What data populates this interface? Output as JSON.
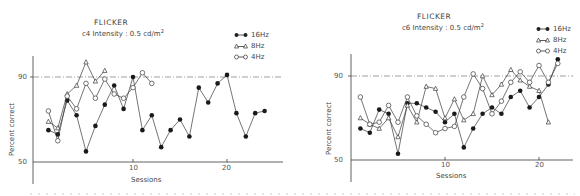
{
  "chart_data": [
    {
      "type": "line",
      "title": "FLICKER",
      "subtitle": "c4 Intensity : 0.5 cd/m²",
      "xlabel": "Sessions",
      "ylabel": "Percent correct",
      "ylim": [
        50,
        100
      ],
      "xlim": [
        0,
        26
      ],
      "yticks": [
        50,
        90
      ],
      "xticks": [
        10,
        20
      ],
      "reference_line": {
        "y": 90,
        "style": "dash-dot"
      },
      "grid": false,
      "legend_position": "top-right",
      "series": [
        {
          "name": "16Hz",
          "marker": "filled-circle",
          "x": [
            1,
            2,
            3,
            4,
            5,
            6,
            7,
            8,
            9,
            10,
            11,
            12,
            13,
            14,
            15,
            16,
            17,
            18,
            19,
            20,
            21,
            22,
            23,
            24
          ],
          "values": [
            65,
            63,
            79,
            72,
            55,
            67,
            77,
            86,
            75,
            90,
            65,
            72,
            57,
            65,
            70,
            62,
            85,
            78,
            87,
            91,
            73,
            62,
            73,
            74
          ]
        },
        {
          "name": "8Hz",
          "marker": "open-triangle",
          "x": [
            1,
            2,
            3,
            4,
            5,
            6,
            7
          ],
          "values": [
            69,
            66,
            82,
            86,
            97,
            88,
            93
          ]
        },
        {
          "name": "4Hz",
          "marker": "open-circle",
          "x": [
            1,
            2,
            3,
            4,
            5,
            6,
            7,
            8,
            9,
            10,
            11,
            12
          ],
          "values": [
            74,
            60,
            81,
            75,
            87,
            80,
            89,
            82,
            80,
            85,
            92,
            87
          ]
        }
      ]
    },
    {
      "type": "line",
      "title": "FLICKER",
      "subtitle": "c6 Intensity : 0.5 cd/m²",
      "xlabel": "Sessions",
      "ylabel": "Percent correct",
      "ylim": [
        50,
        100
      ],
      "xlim": [
        0,
        24
      ],
      "yticks": [
        50,
        90
      ],
      "xticks": [
        10,
        20
      ],
      "reference_line": {
        "y": 90,
        "style": "dash-dot"
      },
      "grid": false,
      "legend_position": "top-right",
      "series": [
        {
          "name": "16Hz",
          "marker": "filled-circle",
          "x": [
            1,
            2,
            3,
            4,
            5,
            6,
            7,
            8,
            9,
            10,
            11,
            12,
            13,
            14,
            15,
            16,
            17,
            18,
            19,
            20,
            21,
            22
          ],
          "values": [
            65,
            63,
            74,
            72,
            53,
            77,
            77,
            75,
            73,
            68,
            72,
            56,
            65,
            72,
            75,
            72,
            80,
            83,
            75,
            80,
            86,
            98
          ]
        },
        {
          "name": "8Hz",
          "marker": "open-triangle",
          "x": [
            1,
            2,
            3,
            4,
            5,
            6,
            7,
            8,
            9,
            10,
            11,
            12,
            13,
            14,
            15,
            16,
            17,
            18,
            19,
            20,
            21
          ],
          "values": [
            70,
            67,
            65,
            70,
            61,
            76,
            68,
            85,
            84,
            70,
            79,
            69,
            72,
            90,
            81,
            86,
            93,
            88,
            85,
            83,
            68
          ]
        },
        {
          "name": "4Hz",
          "marker": "open-circle",
          "x": [
            1,
            2,
            3,
            4,
            5,
            6,
            7,
            8,
            9,
            10,
            11,
            12,
            13,
            14,
            15,
            16,
            17,
            18,
            19,
            20,
            21,
            22
          ],
          "values": [
            80,
            67,
            68,
            76,
            68,
            80,
            71,
            67,
            63,
            65,
            66,
            80,
            91,
            84,
            72,
            78,
            87,
            92,
            87,
            95,
            87,
            96
          ]
        }
      ]
    }
  ],
  "panels": [
    {
      "title": "FLICKER",
      "subtitle_prefix": "c4 Intensity : 0.5 cd/m",
      "subtitle_sup": "2",
      "legend": [
        "16Hz",
        "8Hz",
        "4Hz"
      ],
      "ylabel": "Percent correct",
      "xlabel": "Sessions",
      "ytick_labels": [
        "90",
        "50"
      ],
      "xtick_labels": [
        "10",
        "20"
      ]
    },
    {
      "title": "FLICKER",
      "subtitle_prefix": "c6 Intensity : 0.5 cd/m",
      "subtitle_sup": "2",
      "legend": [
        "16Hz",
        "8Hz",
        "4Hz"
      ],
      "ylabel": "Percent correct",
      "xlabel": "Sessions",
      "ytick_labels": [
        "90",
        "50"
      ],
      "xtick_labels": [
        "10",
        "20"
      ]
    }
  ],
  "colors": {
    "ink": "#3a3a3a",
    "background": "#ffffff"
  }
}
